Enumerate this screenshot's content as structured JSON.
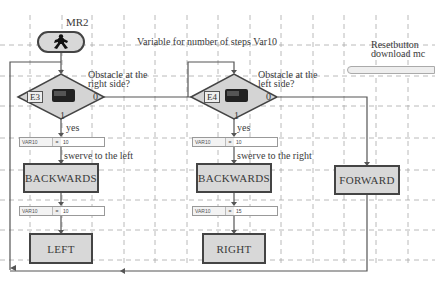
{
  "program": {
    "start_label": "MR2",
    "start_icon": "running-man-icon",
    "comment_variable": "Variable for number of steps Var10",
    "reset": {
      "label_line1": "Resetbutton",
      "label_line2": "download mc"
    }
  },
  "branch_left": {
    "sensor": "E3",
    "question_line1": "Obstacle at the",
    "question_line2": "right side?",
    "out_zero": "0",
    "out_one": "1",
    "yes_label": "yes",
    "var1": {
      "name": "VAR10",
      "op": "=",
      "value": "10"
    },
    "comment": "swerve to the left",
    "action1": "BACKWARDS",
    "var2": {
      "name": "VAR10",
      "op": "=",
      "value": "10"
    },
    "action2": "LEFT"
  },
  "branch_right": {
    "sensor": "E4",
    "question_line1": "Obstacle at the",
    "question_line2": "left side?",
    "out_zero": "0",
    "out_one": "1",
    "yes_label": "yes",
    "var1": {
      "name": "VAR10",
      "op": "=",
      "value": "10"
    },
    "comment": "swerve to the right",
    "action1": "BACKWARDS",
    "var2": {
      "name": "VAR10",
      "op": "=",
      "value": "15"
    },
    "action2": "RIGHT"
  },
  "branch_forward": {
    "action": "FORWARD"
  },
  "colors": {
    "block_fill": "#d8d8d8",
    "block_border": "#444444",
    "grid": "#9a9a9a",
    "line": "#555555"
  }
}
